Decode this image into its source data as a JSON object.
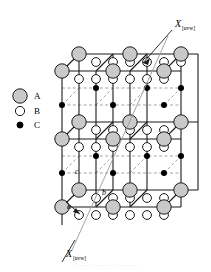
{
  "figure": {
    "type": "crystal-lattice-diagram",
    "title_caption": "",
    "background": "#ffffff"
  },
  "legend": {
    "items": [
      {
        "label": "A",
        "marker": "large-gray-circle",
        "fill": "#c9c9c9",
        "stroke": "#1a1a1a",
        "radius": 7.2
      },
      {
        "label": "B",
        "marker": "medium-open-circle",
        "fill": "#ffffff",
        "stroke": "#1a1a1a",
        "radius": 4.6
      },
      {
        "label": "C",
        "marker": "small-black-circle",
        "fill": "#000000",
        "stroke": "#000000",
        "radius": 3.0
      }
    ]
  },
  "direction_labels": {
    "top": {
      "symbol": "X",
      "subscript": "[uvw]"
    },
    "bottom": {
      "symbol": "X",
      "subscript": "[uvw]"
    }
  },
  "lattice_vectors": [
    {
      "label": "a"
    },
    {
      "label": "b"
    },
    {
      "label": "c"
    }
  ],
  "colors": {
    "atom_a_fill": "#c9c9c9",
    "atom_b_fill": "#ffffff",
    "atom_c_fill": "#000000",
    "edge_solid": "#1a1a1a",
    "edge_dashed": "#9a9a9a",
    "outline": "#1a1a1a"
  },
  "geometry": {
    "cell_dx": 34,
    "cell_dy": 34,
    "persp_dx": 17,
    "persp_dy": -13,
    "origin_x": 62,
    "origin_y": 225,
    "cols": 3,
    "rows": 3
  },
  "caption": {
    "text": "· ····  ···· · ·····  ··· ··  ······ ···"
  }
}
